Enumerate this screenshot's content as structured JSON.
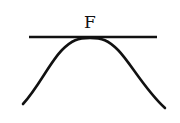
{
  "diagram": {
    "label": "F",
    "elements": [
      {
        "type": "tangent-line",
        "description": "horizontal line touching top of curve"
      },
      {
        "type": "curve",
        "description": "bell-shaped curve (hump)"
      }
    ],
    "colors": {
      "stroke": "#111111",
      "background": "#ffffff"
    }
  }
}
